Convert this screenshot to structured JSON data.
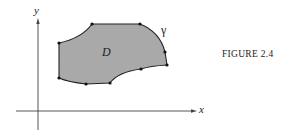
{
  "figure": {
    "caption": "FIGURE 2.4",
    "axis_x_label": "x",
    "axis_y_label": "y",
    "region_label": "D",
    "boundary_label": "γ",
    "region_fill": "#a9a9a9",
    "stroke": "#222222"
  }
}
